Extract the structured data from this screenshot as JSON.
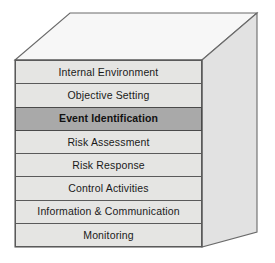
{
  "diagram": {
    "shape": "cube",
    "faces": {
      "top": {
        "name": "top-face",
        "color": "#f7f7f7"
      },
      "right": {
        "name": "right-face",
        "color": "#e2e2e2"
      },
      "front": {
        "name": "front-face",
        "color": "#e5e5e3"
      }
    },
    "colors": {
      "row_fill": "#e5e5e3",
      "row_highlight_fill": "#a9a9a9",
      "border": "#5a5a5a",
      "top_face": "#f7f7f7",
      "right_face": "#e2e2e2",
      "text": "#1a1a1a",
      "background": "#ffffff"
    },
    "components": [
      {
        "label": "Internal Environment",
        "highlighted": false
      },
      {
        "label": "Objective Setting",
        "highlighted": false
      },
      {
        "label": "Event Identification",
        "highlighted": true
      },
      {
        "label": "Risk Assessment",
        "highlighted": false
      },
      {
        "label": "Risk Response",
        "highlighted": false
      },
      {
        "label": "Control Activities",
        "highlighted": false
      },
      {
        "label": "Information & Communication",
        "highlighted": false
      },
      {
        "label": "Monitoring",
        "highlighted": false
      }
    ]
  }
}
